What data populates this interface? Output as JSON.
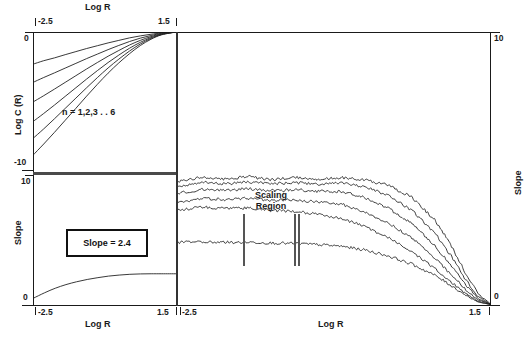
{
  "figure": {
    "title": "",
    "panels": [
      "upper-left-log-c-vs-log-r",
      "lower-left-slope-vs-log-r",
      "right-slope-vs-log-r"
    ]
  },
  "upper_left": {
    "x_axis_label": "Log R",
    "y_axis_label": "Log C (R)",
    "x_tick_min": "-2.5",
    "x_tick_max": "1.5",
    "y_tick_max": "0",
    "y_tick_min": "-10",
    "annotation": "n = 1,2,3 . . 6"
  },
  "lower_left": {
    "x_axis_label": "Log R",
    "y_axis_label": "Slope",
    "x_tick_min": "-2.5",
    "x_tick_max": "1.5",
    "y_tick_max": "10",
    "y_tick_min": "0",
    "slope_box_label": "Slope = 2.4"
  },
  "right": {
    "x_axis_label": "Log R",
    "y_axis_label": "Slope",
    "x_tick_min": "-2.5",
    "x_tick_max": "1.5",
    "y_tick_max": "10",
    "y_tick_min": "0",
    "scaling_region_label_line1": "Scaling",
    "scaling_region_label_line2": "Region"
  },
  "colors": {
    "ink": "#1a1a1a",
    "curve": "#222222",
    "marker": "#555555",
    "background": "#ffffff"
  },
  "chart_data": [
    {
      "type": "line",
      "id": "upper-left",
      "title": "Log C (R) vs Log R",
      "xlabel": "Log R",
      "ylabel": "Log C (R)",
      "xlim": [
        -2.5,
        1.5
      ],
      "ylim": [
        -10,
        0
      ],
      "grid": false,
      "legend": "n = 1,2,3 . . 6",
      "x": [
        -2.5,
        -2.2,
        -1.9,
        -1.6,
        -1.3,
        -1.0,
        -0.7,
        -0.4,
        -0.1,
        0.2,
        0.5,
        0.8,
        1.1,
        1.5
      ],
      "series": [
        {
          "name": "n = 1",
          "values": [
            -2.3,
            -2.05,
            -1.85,
            -1.62,
            -1.4,
            -1.18,
            -0.98,
            -0.78,
            -0.6,
            -0.42,
            -0.28,
            -0.16,
            -0.07,
            0.0
          ]
        },
        {
          "name": "n = 2",
          "values": [
            -3.6,
            -3.25,
            -2.92,
            -2.58,
            -2.24,
            -1.9,
            -1.58,
            -1.26,
            -0.96,
            -0.68,
            -0.44,
            -0.25,
            -0.1,
            0.0
          ]
        },
        {
          "name": "n = 3",
          "values": [
            -5.0,
            -4.55,
            -4.08,
            -3.6,
            -3.12,
            -2.64,
            -2.18,
            -1.73,
            -1.32,
            -0.93,
            -0.6,
            -0.33,
            -0.13,
            0.0
          ]
        },
        {
          "name": "n = 4",
          "values": [
            -6.4,
            -5.82,
            -5.22,
            -4.6,
            -3.98,
            -3.36,
            -2.76,
            -2.18,
            -1.65,
            -1.16,
            -0.74,
            -0.4,
            -0.16,
            0.0
          ]
        },
        {
          "name": "n = 5",
          "values": [
            -7.6,
            -6.92,
            -6.2,
            -5.46,
            -4.72,
            -3.98,
            -3.26,
            -2.57,
            -1.94,
            -1.36,
            -0.86,
            -0.46,
            -0.18,
            0.0
          ]
        },
        {
          "name": "n = 6",
          "values": [
            -8.8,
            -8.0,
            -7.17,
            -6.31,
            -5.45,
            -4.58,
            -3.74,
            -2.94,
            -2.21,
            -1.55,
            -0.97,
            -0.52,
            -0.2,
            0.0
          ]
        }
      ]
    },
    {
      "type": "line",
      "id": "lower-left",
      "title": "Slope vs Log R (single curve, slope = 2.4)",
      "xlabel": "Log R",
      "ylabel": "Slope",
      "xlim": [
        -2.5,
        1.5
      ],
      "ylim": [
        0,
        10
      ],
      "grid": false,
      "annotation": "Slope = 2.4",
      "x": [
        -2.5,
        -2.2,
        -1.9,
        -1.6,
        -1.3,
        -1.0,
        -0.7,
        -0.4,
        -0.1,
        0.2,
        0.5,
        0.8,
        1.1,
        1.5
      ],
      "series": [
        {
          "name": "slope",
          "values": [
            0.55,
            0.95,
            1.3,
            1.58,
            1.8,
            1.98,
            2.12,
            2.24,
            2.32,
            2.38,
            2.41,
            2.42,
            2.42,
            2.42
          ]
        }
      ]
    },
    {
      "type": "line",
      "id": "right",
      "title": "Slope vs Log R for n = 1..6 with scaling region",
      "xlabel": "Log R",
      "ylabel": "Slope",
      "xlim": [
        -2.5,
        1.5
      ],
      "ylim": [
        0,
        10
      ],
      "grid": false,
      "scaling_region_x": [
        -1.35,
        -0.35
      ],
      "x": [
        -2.5,
        -2.2,
        -1.9,
        -1.6,
        -1.3,
        -1.0,
        -0.7,
        -0.4,
        -0.1,
        0.2,
        0.5,
        0.8,
        1.0,
        1.2,
        1.35,
        1.5
      ],
      "series": [
        {
          "name": "n = 6",
          "values": [
            4.55,
            4.7,
            4.62,
            4.72,
            4.6,
            4.7,
            4.62,
            4.68,
            4.6,
            4.4,
            3.95,
            3.1,
            2.2,
            1.1,
            0.4,
            0.05
          ]
        },
        {
          "name": "n = 5",
          "values": [
            4.35,
            4.5,
            4.45,
            4.52,
            4.44,
            4.5,
            4.44,
            4.48,
            4.34,
            4.02,
            3.48,
            2.62,
            1.8,
            0.88,
            0.3,
            0.04
          ]
        },
        {
          "name": "n = 4",
          "values": [
            4.1,
            4.25,
            4.22,
            4.28,
            4.2,
            4.24,
            4.18,
            4.16,
            3.95,
            3.55,
            2.98,
            2.16,
            1.45,
            0.7,
            0.24,
            0.03
          ]
        },
        {
          "name": "n = 3",
          "values": [
            3.75,
            3.92,
            3.88,
            3.92,
            3.85,
            3.86,
            3.78,
            3.7,
            3.42,
            3.0,
            2.46,
            1.72,
            1.12,
            0.54,
            0.18,
            0.03
          ]
        },
        {
          "name": "n = 2",
          "values": [
            3.5,
            3.6,
            3.55,
            3.56,
            3.48,
            3.44,
            3.34,
            3.18,
            2.88,
            2.46,
            1.96,
            1.32,
            0.84,
            0.4,
            0.13,
            0.02
          ]
        },
        {
          "name": "n = 1",
          "values": [
            2.3,
            2.32,
            2.3,
            2.31,
            2.28,
            2.26,
            2.22,
            2.16,
            2.02,
            1.8,
            1.5,
            1.08,
            0.72,
            0.34,
            0.11,
            0.02
          ]
        }
      ]
    }
  ]
}
